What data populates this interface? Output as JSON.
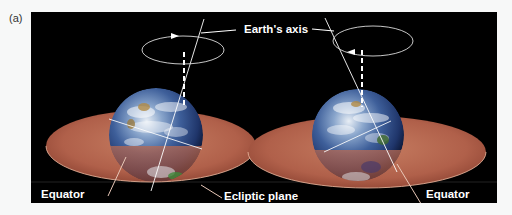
{
  "figure": {
    "panel_label": "(a)",
    "labels": {
      "earth_axis": "Earth's axis",
      "equator_left": "Equator",
      "ecliptic_plane": "Ecliptic plane",
      "equator_right": "Equator"
    },
    "colors": {
      "background": "#000000",
      "plane": "#b86a52",
      "line": "#ffffff"
    }
  }
}
